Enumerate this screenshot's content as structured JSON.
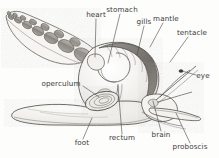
{
  "figure": {
    "style": "pencil line drawing, grayscale",
    "background_color": "#fdfdfc",
    "ink_color": "#4a4a4a",
    "label_color": "#3b3b3b"
  },
  "labels": [
    {
      "id": "heart",
      "text": "heart",
      "x": 96,
      "y": 15,
      "anchor": "middle"
    },
    {
      "id": "stomach",
      "text": "stomach",
      "x": 122,
      "y": 10,
      "anchor": "middle"
    },
    {
      "id": "gills",
      "text": "gills",
      "x": 144,
      "y": 22,
      "anchor": "middle"
    },
    {
      "id": "mantle",
      "text": "mantle",
      "x": 166,
      "y": 19,
      "anchor": "middle"
    },
    {
      "id": "tentacle",
      "text": "tentacle",
      "x": 192,
      "y": 33,
      "anchor": "middle"
    },
    {
      "id": "eye",
      "text": "eye",
      "x": 203,
      "y": 76,
      "anchor": "middle"
    },
    {
      "id": "operculum",
      "text": "operculum",
      "x": 61,
      "y": 84,
      "anchor": "middle"
    },
    {
      "id": "foot",
      "text": "foot",
      "x": 82,
      "y": 143,
      "anchor": "middle"
    },
    {
      "id": "rectum",
      "text": "rectum",
      "x": 122,
      "y": 138,
      "anchor": "middle"
    },
    {
      "id": "brain",
      "text": "brain",
      "x": 161,
      "y": 135,
      "anchor": "middle"
    },
    {
      "id": "proboscis",
      "text": "proboscis",
      "x": 190,
      "y": 147,
      "anchor": "middle"
    }
  ],
  "leader_lines": [
    {
      "id": "heart-leader",
      "from": [
        96,
        19
      ],
      "to": [
        95,
        57
      ]
    },
    {
      "id": "stomach-leader",
      "from": [
        120,
        14
      ],
      "to": [
        108,
        63
      ]
    },
    {
      "id": "gills-leader",
      "from": [
        144,
        26
      ],
      "to": [
        137,
        55
      ]
    },
    {
      "id": "mantle-leader",
      "from": [
        163,
        23
      ],
      "to": [
        150,
        47
      ]
    },
    {
      "id": "tentacle-leader",
      "from": [
        188,
        37
      ],
      "to": [
        170,
        62
      ]
    },
    {
      "id": "eye-leader",
      "from": [
        196,
        75
      ],
      "to": [
        182,
        71
      ]
    },
    {
      "id": "operculum-leader",
      "from": [
        83,
        86
      ],
      "to": [
        99,
        97
      ]
    },
    {
      "id": "foot-leader",
      "from": [
        83,
        139
      ],
      "to": [
        92,
        118
      ]
    },
    {
      "id": "rectum-leader",
      "from": [
        122,
        134
      ],
      "to": [
        118,
        86
      ]
    },
    {
      "id": "brain-leader",
      "from": [
        161,
        131
      ],
      "to": [
        153,
        101
      ]
    },
    {
      "id": "proboscis-leader",
      "from": [
        190,
        143
      ],
      "to": [
        176,
        113
      ]
    }
  ],
  "shell": {
    "id": "shell-spiral",
    "description": "tapering conical spire with banded whorls, pointing up-left",
    "whorl_count": 9
  },
  "body_parts": [
    {
      "id": "body-whorl",
      "description": "rounded body whorl containing the visceral mass"
    },
    {
      "id": "foot-mass",
      "description": "large muscular foot extending forward-left to a point"
    },
    {
      "id": "head-region",
      "description": "head with tentacles, eyes and extended proboscis at right"
    }
  ]
}
